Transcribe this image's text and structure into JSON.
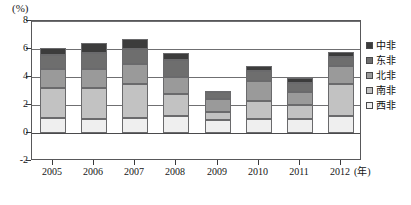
{
  "chart_data": {
    "type": "bar",
    "stacked": true,
    "title": "",
    "subtitle": "",
    "xlabel": "(年)",
    "ylabel": "(%)",
    "unit_label": "(%)",
    "categories": [
      "2005",
      "2006",
      "2007",
      "2008",
      "2009",
      "2010",
      "2011",
      "2012"
    ],
    "ylim": [
      -2,
      8
    ],
    "yticks": [
      -2,
      0,
      2,
      4,
      6,
      8
    ],
    "ytick_labels": [
      "-2",
      "0",
      "2",
      "4",
      "6",
      "8"
    ],
    "grid": true,
    "legend_position": "right",
    "series": [
      {
        "name": "西非",
        "color": "#efefef",
        "values": [
          1.1,
          1.0,
          1.1,
          1.2,
          0.9,
          1.0,
          1.0,
          1.2
        ]
      },
      {
        "name": "南非",
        "color": "#c2c2c2",
        "values": [
          2.1,
          2.2,
          2.4,
          1.6,
          0.6,
          1.3,
          1.0,
          2.3
        ]
      },
      {
        "name": "北非",
        "color": "#9a9a9a",
        "values": [
          1.4,
          1.4,
          1.4,
          1.2,
          0.9,
          1.4,
          0.9,
          1.3
        ]
      },
      {
        "name": "东非",
        "color": "#6e6e6e",
        "values": [
          1.0,
          1.1,
          1.1,
          1.2,
          0.5,
          0.7,
          0.7,
          0.6
        ]
      },
      {
        "name": "中非",
        "color": "#3c3c3c",
        "values": [
          0.5,
          0.7,
          0.7,
          0.5,
          0.1,
          0.4,
          0.3,
          0.4
        ]
      }
    ],
    "totals": [
      6.1,
      6.4,
      6.7,
      5.7,
      3.0,
      4.8,
      3.9,
      5.8
    ]
  },
  "legend": {
    "items": [
      {
        "label": "中非",
        "color": "#3c3c3c"
      },
      {
        "label": "东非",
        "color": "#6e6e6e"
      },
      {
        "label": "北非",
        "color": "#9a9a9a"
      },
      {
        "label": "南非",
        "color": "#c2c2c2"
      },
      {
        "label": "西非",
        "color": "#efefef"
      }
    ]
  }
}
